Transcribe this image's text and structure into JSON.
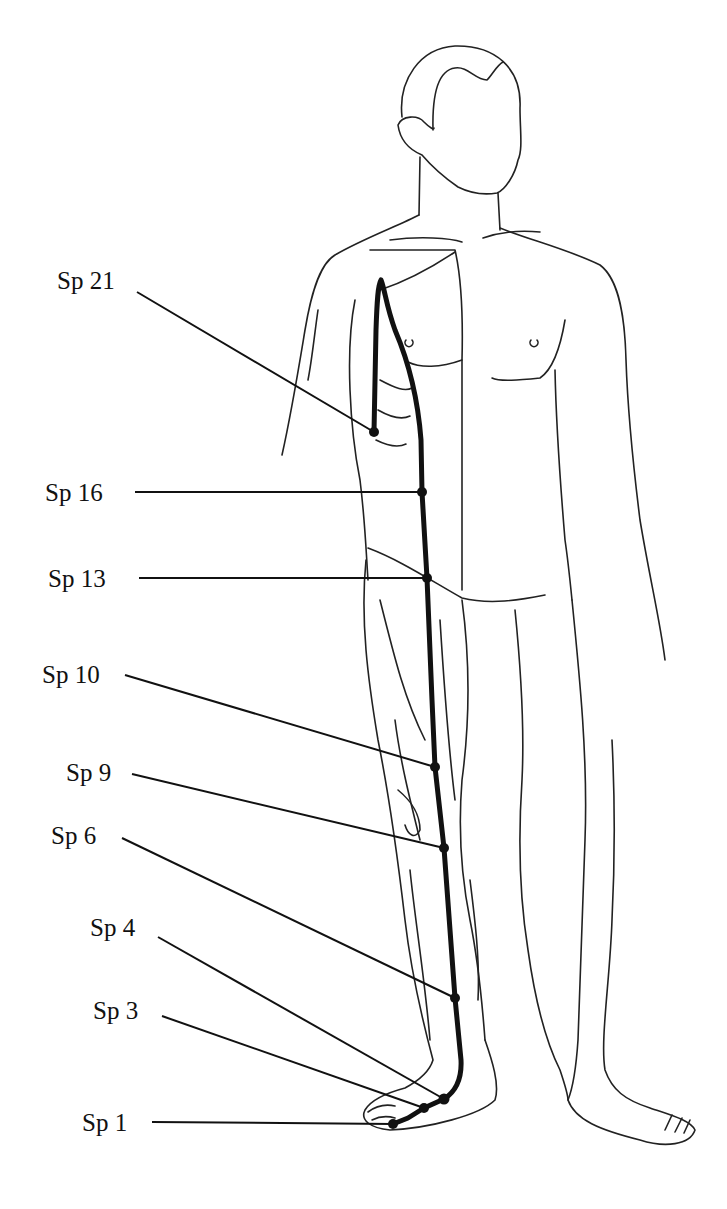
{
  "diagram": {
    "line_color": "#111111",
    "points": [
      {
        "label": "Sp 21",
        "label_x": 57,
        "label_y": 268,
        "line_start": [
          137,
          292
        ],
        "point": [
          374,
          432
        ]
      },
      {
        "label": "Sp 16",
        "label_x": 45,
        "label_y": 480,
        "line_start": [
          135,
          492
        ],
        "point": [
          422,
          492
        ]
      },
      {
        "label": "Sp 13",
        "label_x": 48,
        "label_y": 566,
        "line_start": [
          139,
          578
        ],
        "point": [
          427,
          578
        ]
      },
      {
        "label": "Sp 10",
        "label_x": 42,
        "label_y": 662,
        "line_start": [
          125,
          675
        ],
        "point": [
          435,
          767
        ]
      },
      {
        "label": "Sp 9",
        "label_x": 66,
        "label_y": 760,
        "line_start": [
          132,
          774
        ],
        "point": [
          444,
          848
        ]
      },
      {
        "label": "Sp 6",
        "label_x": 51,
        "label_y": 823,
        "line_start": [
          122,
          838
        ],
        "point": [
          455,
          998
        ]
      },
      {
        "label": "Sp 4",
        "label_x": 90,
        "label_y": 915,
        "line_start": [
          158,
          937
        ],
        "point": [
          444,
          1099
        ]
      },
      {
        "label": "Sp 3",
        "label_x": 93,
        "label_y": 998,
        "line_start": [
          162,
          1016
        ],
        "point": [
          424,
          1108
        ]
      },
      {
        "label": "Sp 1",
        "label_x": 82,
        "label_y": 1110,
        "line_start": [
          152,
          1122
        ],
        "point": [
          393,
          1124
        ]
      }
    ]
  }
}
